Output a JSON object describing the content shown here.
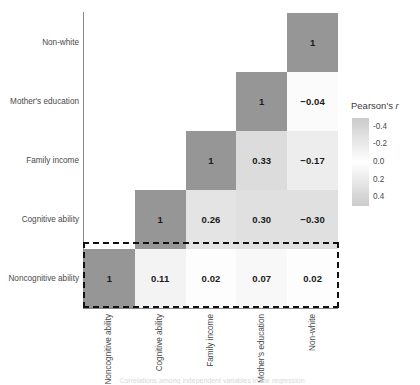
{
  "chart_data": {
    "type": "heatmap",
    "title": "",
    "legend_title": "Pearson's r",
    "legend_title_plain": "Pearson's",
    "legend_title_italic": "r",
    "legend_position": "right",
    "grid": false,
    "zlim": [
      -0.5,
      0.5
    ],
    "legend_ticks": [
      "-0.4",
      "-0.2",
      "0.0",
      "0.2",
      "0.4"
    ],
    "legend_tick_values": [
      -0.4,
      -0.2,
      0.0,
      0.2,
      0.4
    ],
    "xlabel": "",
    "ylabel": "",
    "categories": [
      "Noncognitive ability",
      "Cognitive ability",
      "Family income",
      "Mother's education",
      "Non-white"
    ],
    "xtick_labels": [
      "Noncognitive ability",
      "Cognitive ability",
      "Family income",
      "Mother's education",
      "Non-white"
    ],
    "ytick_labels": [
      "Non-white",
      "Mother's education",
      "Family income",
      "Cognitive ability",
      "Noncognitive ability"
    ],
    "matrix_form": "lower-triangular",
    "rows": [
      {
        "row_label": "Non-white",
        "cells": [
          {
            "col": "Noncognitive ability",
            "value": null,
            "text": ""
          },
          {
            "col": "Cognitive ability",
            "value": null,
            "text": ""
          },
          {
            "col": "Family income",
            "value": null,
            "text": ""
          },
          {
            "col": "Mother's education",
            "value": null,
            "text": ""
          },
          {
            "col": "Non-white",
            "value": 1,
            "text": "1"
          }
        ]
      },
      {
        "row_label": "Mother's education",
        "cells": [
          {
            "col": "Noncognitive ability",
            "value": null,
            "text": ""
          },
          {
            "col": "Cognitive ability",
            "value": null,
            "text": ""
          },
          {
            "col": "Family income",
            "value": null,
            "text": ""
          },
          {
            "col": "Mother's education",
            "value": 1,
            "text": "1"
          },
          {
            "col": "Non-white",
            "value": -0.04,
            "text": "−0.04"
          }
        ]
      },
      {
        "row_label": "Family income",
        "cells": [
          {
            "col": "Noncognitive ability",
            "value": null,
            "text": ""
          },
          {
            "col": "Cognitive ability",
            "value": null,
            "text": ""
          },
          {
            "col": "Family income",
            "value": 1,
            "text": "1"
          },
          {
            "col": "Mother's education",
            "value": 0.33,
            "text": "0.33"
          },
          {
            "col": "Non-white",
            "value": -0.17,
            "text": "−0.17"
          }
        ]
      },
      {
        "row_label": "Cognitive ability",
        "cells": [
          {
            "col": "Noncognitive ability",
            "value": null,
            "text": ""
          },
          {
            "col": "Cognitive ability",
            "value": 1,
            "text": "1"
          },
          {
            "col": "Family income",
            "value": 0.26,
            "text": "0.26"
          },
          {
            "col": "Mother's education",
            "value": 0.3,
            "text": "0.30"
          },
          {
            "col": "Non-white",
            "value": -0.3,
            "text": "−0.30"
          }
        ]
      },
      {
        "row_label": "Noncognitive ability",
        "cells": [
          {
            "col": "Noncognitive ability",
            "value": 1,
            "text": "1"
          },
          {
            "col": "Cognitive ability",
            "value": 0.11,
            "text": "0.11"
          },
          {
            "col": "Family income",
            "value": 0.02,
            "text": "0.02"
          },
          {
            "col": "Mother's education",
            "value": 0.07,
            "text": "0.07"
          },
          {
            "col": "Non-white",
            "value": 0.02,
            "text": "0.02"
          }
        ]
      }
    ],
    "annotations": [
      {
        "name": "highlight-box",
        "style": "dashed-rectangle",
        "targets_row": "Noncognitive ability"
      }
    ]
  },
  "colors": {
    "diagonal_gray": "#999999",
    "mid_gray": "#b0b0b0",
    "light_gray": "#e3e3e3",
    "near_white": "#f6f6f6",
    "white": "#ffffff",
    "axis": "#888888",
    "text": "#3c3c3c",
    "value_text": "#1a1a1a",
    "dash": "#111111"
  },
  "caption": {
    "text": "Correlations among independent variables in the regression"
  }
}
